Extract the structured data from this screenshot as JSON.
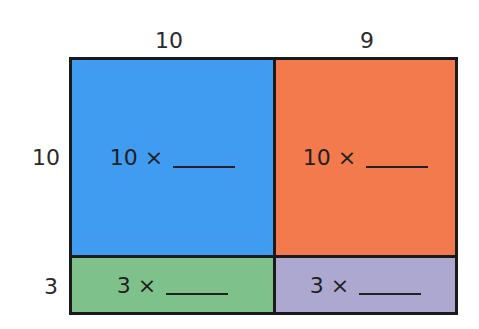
{
  "top_labels": [
    "10",
    "9"
  ],
  "side_labels": [
    "10",
    "3"
  ],
  "cells": [
    {
      "text": "10 ×",
      "color": "#3f9cf0"
    },
    {
      "text": "10 ×",
      "color": "#f27a4c"
    },
    {
      "text": "3 ×",
      "color": "#7fc18a"
    },
    {
      "text": "3 ×",
      "color": "#aca8d0"
    }
  ]
}
